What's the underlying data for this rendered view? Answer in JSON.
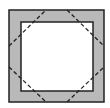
{
  "diagram": {
    "colors": {
      "background": "#ffffff",
      "band_fill": "#b9b9b9",
      "inner_fill": "#ffffff",
      "stroke": "#222222",
      "dash_stroke": "#222222"
    },
    "outer_square": {
      "x": 9,
      "y": 10,
      "width": 95,
      "height": 92
    },
    "inner_square": {
      "x": 21,
      "y": 22,
      "width": 72,
      "height": 69
    },
    "dashed_segments": [
      {
        "name": "top-left",
        "x1": 9,
        "y1": 46,
        "x2": 46,
        "y2": 10
      },
      {
        "name": "top-right",
        "x1": 67,
        "y1": 10,
        "x2": 104,
        "y2": 46
      },
      {
        "name": "bottom-left",
        "x1": 9,
        "y1": 67,
        "x2": 46,
        "y2": 102
      },
      {
        "name": "bottom-right",
        "x1": 67,
        "y1": 102,
        "x2": 104,
        "y2": 67
      }
    ]
  }
}
